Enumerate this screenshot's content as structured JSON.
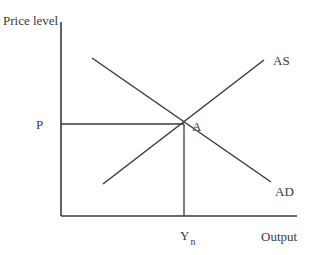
{
  "diagram": {
    "title_partial": "                          ",
    "axes": {
      "y_label": "Price level",
      "x_label": "Output"
    },
    "curves": [
      {
        "name": "AS",
        "label": "AS",
        "slope": "upward"
      },
      {
        "name": "AD",
        "label": "AD",
        "slope": "downward"
      }
    ],
    "equilibrium": {
      "point_label": "A",
      "price_label": "P",
      "output_label_main": "Y",
      "output_label_sub": "n"
    },
    "colors": {
      "line": "#3a3a3a",
      "background": "#ffffff"
    }
  }
}
